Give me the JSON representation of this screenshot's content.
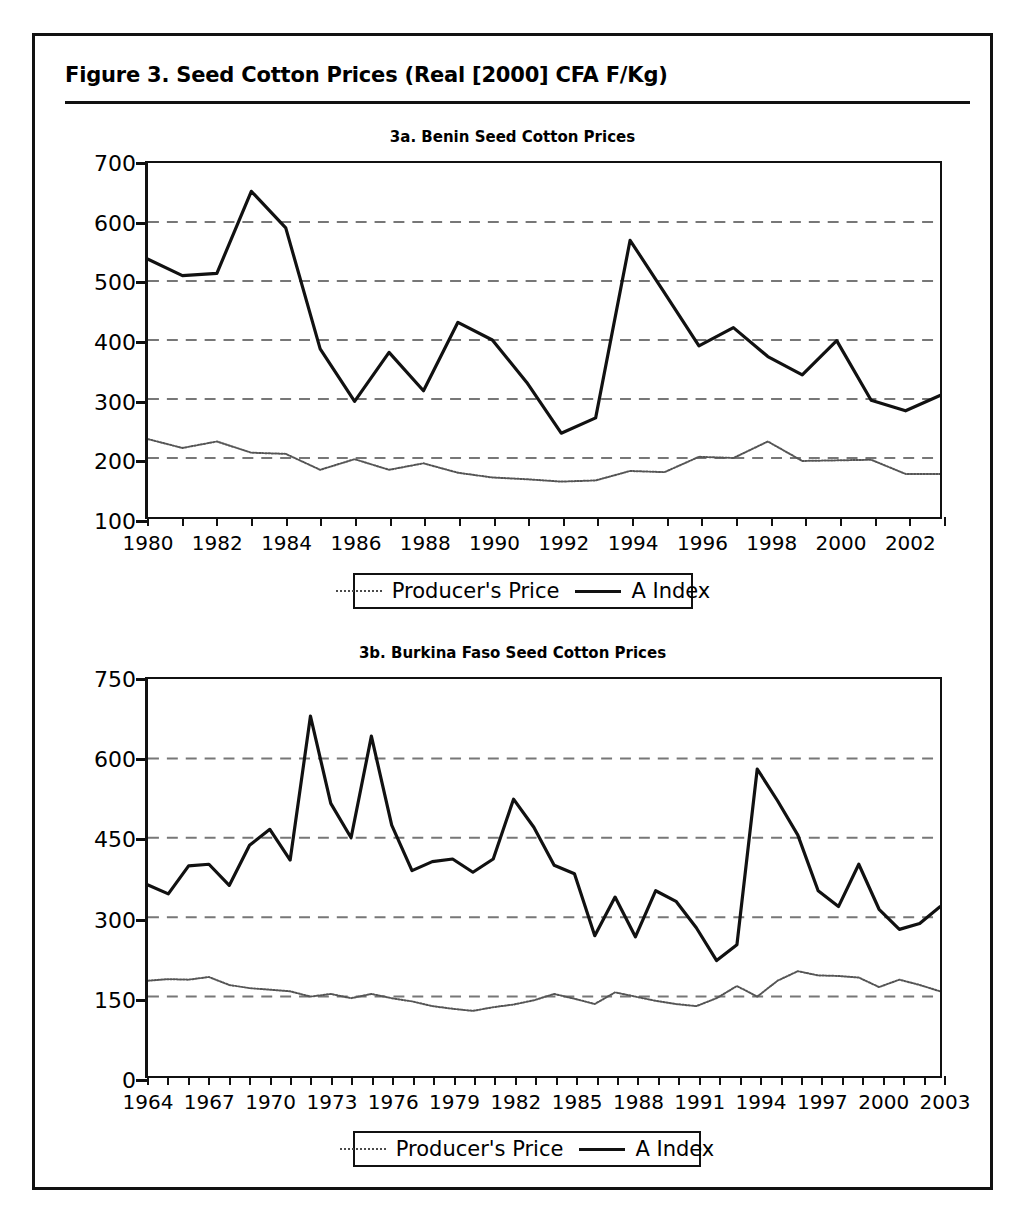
{
  "figure": {
    "title": "Figure 3.  Seed Cotton Prices (Real [2000] CFA F/Kg)"
  },
  "legend": {
    "producer_label": "Producer's Price",
    "aindex_label": "A Index"
  },
  "colors": {
    "producer_line": "#555555",
    "aindex_line": "#111111",
    "gridline": "#777777",
    "axis": "#111111",
    "frame": "#111111"
  },
  "chart_data": [
    {
      "type": "line",
      "title": "3a. Benin Seed Cotton Prices",
      "xlabel": "",
      "ylabel": "",
      "xlim": [
        1980,
        2003
      ],
      "ylim": [
        100,
        700
      ],
      "yticks": [
        100,
        200,
        300,
        400,
        500,
        600,
        700
      ],
      "ytick_labels": [
        "100",
        "200",
        "300",
        "400",
        "500",
        "600",
        "700"
      ],
      "gridlines": [
        200,
        300,
        400,
        500,
        600
      ],
      "grid": true,
      "legend_position": "below",
      "xticks": [
        1980,
        1981,
        1982,
        1983,
        1984,
        1985,
        1986,
        1987,
        1988,
        1989,
        1990,
        1991,
        1992,
        1993,
        1994,
        1995,
        1996,
        1997,
        1998,
        1999,
        2000,
        2001,
        2002,
        2003
      ],
      "xtick_labels": [
        "1980",
        "1982",
        "1984",
        "1986",
        "1988",
        "1990",
        "1992",
        "1994",
        "1996",
        "1998",
        "2000",
        "2002"
      ],
      "xtick_label_years": [
        1980,
        1982,
        1984,
        1986,
        1988,
        1990,
        1992,
        1994,
        1996,
        1998,
        2000,
        2002
      ],
      "x": [
        1980,
        1981,
        1982,
        1983,
        1984,
        1985,
        1986,
        1987,
        1988,
        1989,
        1990,
        1991,
        1992,
        1993,
        1994,
        1995,
        1996,
        1997,
        1998,
        1999,
        2000,
        2001,
        2002,
        2003
      ],
      "series": [
        {
          "name": "A Index",
          "style": "solid",
          "values": [
            537,
            509,
            513,
            652,
            590,
            385,
            296,
            379,
            314,
            430,
            400,
            328,
            242,
            268,
            569,
            480,
            390,
            421,
            372,
            341,
            399,
            298,
            280,
            306
          ]
        },
        {
          "name": "Producer's Price",
          "style": "dotted",
          "values": [
            232,
            217,
            228,
            209,
            207,
            180,
            198,
            180,
            191,
            175,
            167,
            164,
            160,
            162,
            178,
            176,
            202,
            200,
            228,
            195,
            196,
            197,
            173,
            173
          ]
        }
      ]
    },
    {
      "type": "line",
      "title": "3b. Burkina Faso Seed Cotton Prices",
      "xlabel": "",
      "ylabel": "",
      "xlim": [
        1964,
        2003
      ],
      "ylim": [
        0,
        750
      ],
      "yticks": [
        0,
        150,
        300,
        450,
        600,
        750
      ],
      "ytick_labels": [
        "0",
        "150",
        "300",
        "450",
        "600",
        "750"
      ],
      "gridlines": [
        150,
        300,
        450,
        600
      ],
      "grid": true,
      "legend_position": "below",
      "xticks": [
        1964,
        1965,
        1966,
        1967,
        1968,
        1969,
        1970,
        1971,
        1972,
        1973,
        1974,
        1975,
        1976,
        1977,
        1978,
        1979,
        1980,
        1981,
        1982,
        1983,
        1984,
        1985,
        1986,
        1987,
        1988,
        1989,
        1990,
        1991,
        1992,
        1993,
        1994,
        1995,
        1996,
        1997,
        1998,
        1999,
        2000,
        2001,
        2002,
        2003
      ],
      "xtick_labels": [
        "1964",
        "1967",
        "1970",
        "1973",
        "1976",
        "1979",
        "1982",
        "1985",
        "1988",
        "1991",
        "1994",
        "1997",
        "2000",
        "2003"
      ],
      "xtick_label_years": [
        1964,
        1967,
        1970,
        1973,
        1976,
        1979,
        1982,
        1985,
        1988,
        1991,
        1994,
        1997,
        2000,
        2003
      ],
      "x": [
        1964,
        1965,
        1966,
        1967,
        1968,
        1969,
        1970,
        1971,
        1972,
        1973,
        1974,
        1975,
        1976,
        1977,
        1978,
        1979,
        1980,
        1981,
        1982,
        1983,
        1984,
        1985,
        1986,
        1987,
        1988,
        1989,
        1990,
        1991,
        1992,
        1993,
        1994,
        1995,
        1996,
        1997,
        1998,
        1999,
        2000,
        2001,
        2002,
        2003
      ],
      "series": [
        {
          "name": "A Index",
          "style": "solid",
          "values": [
            361,
            344,
            397,
            400,
            360,
            436,
            466,
            408,
            680,
            515,
            450,
            642,
            474,
            388,
            405,
            410,
            385,
            410,
            523,
            470,
            398,
            382,
            265,
            338,
            263,
            350,
            330,
            280,
            218,
            248,
            580,
            520,
            455,
            350,
            320,
            400,
            315,
            277,
            288,
            320
          ]
        },
        {
          "name": "Producer's Price",
          "style": "dotted",
          "values": [
            180,
            183,
            182,
            187,
            172,
            166,
            163,
            160,
            150,
            155,
            147,
            155,
            147,
            141,
            132,
            127,
            123,
            130,
            135,
            143,
            155,
            146,
            136,
            158,
            150,
            142,
            136,
            132,
            147,
            170,
            150,
            180,
            198,
            190,
            189,
            186,
            168,
            182,
            172,
            160
          ]
        }
      ]
    }
  ]
}
